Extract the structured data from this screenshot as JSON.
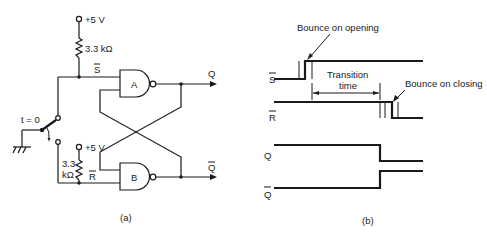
{
  "figure_a": {
    "caption": "(a)",
    "supply_top": "+5 V",
    "supply_bottom": "+5 V",
    "resistor_top": "3.3 kΩ",
    "resistor_bottom_line1": "3.3",
    "resistor_bottom_line2": "kΩ",
    "switch_label": "t = 0",
    "node_s": "S",
    "node_r": "R",
    "gate_a": "A",
    "gate_b": "B",
    "output_q": "Q",
    "output_qbar": "Q"
  },
  "figure_b": {
    "caption": "(b)",
    "signals": [
      {
        "name": "S",
        "overbar": true
      },
      {
        "name": "R",
        "overbar": true
      },
      {
        "name": "Q",
        "overbar": false
      },
      {
        "name": "Q",
        "overbar": true
      }
    ],
    "annotation_opening": "Bounce on opening",
    "annotation_closing": "Bounce on closing",
    "transition_line1": "Transition",
    "transition_line2": "time"
  }
}
